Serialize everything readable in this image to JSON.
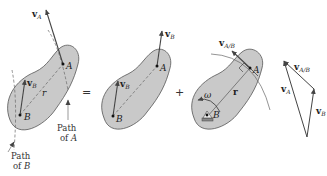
{
  "diagram": {
    "equation_operators": {
      "equals": "=",
      "plus": "+"
    },
    "panel1": {
      "point_A": "A",
      "point_B": "B",
      "vel_A": {
        "main": "v",
        "sub": "A"
      },
      "vel_B": {
        "main": "v",
        "sub": "B"
      },
      "radius": "r",
      "path_A": {
        "line1": "Path",
        "line2": "of",
        "line2_it": "A"
      },
      "path_B": {
        "line1": "Path",
        "line2": "of",
        "line2_it": "B"
      }
    },
    "panel2": {
      "point_A": "A",
      "point_B": "B",
      "vel_B_at_A": {
        "main": "v",
        "sub": "B"
      },
      "vel_B_at_B": {
        "main": "v",
        "sub": "B"
      }
    },
    "panel3": {
      "point_A": "A",
      "point_B": "B",
      "vel_AB": {
        "main": "v",
        "sub": "A/B"
      },
      "radius": "r",
      "omega": "ω"
    },
    "vector_triangle": {
      "vel_A": {
        "main": "v",
        "sub": "A"
      },
      "vel_B": {
        "main": "v",
        "sub": "B"
      },
      "vel_AB": {
        "main": "v",
        "sub": "A/B"
      }
    },
    "colors": {
      "body_fill": "#c9c9c9",
      "body_stroke": "#555555",
      "vector": "#444444",
      "path_line": "#666666"
    }
  }
}
